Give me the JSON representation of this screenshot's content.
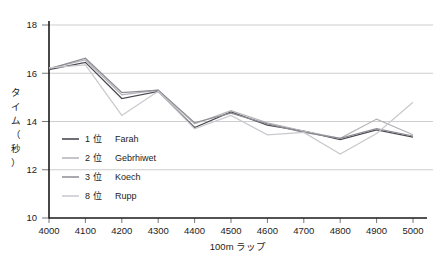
{
  "chart_data": {
    "type": "line",
    "title": "",
    "xlabel": "100m ラップ",
    "ylabel": "タイム（秒）",
    "ylabel_chars": [
      "タ",
      "イ",
      "ム",
      "（",
      "秒",
      "）"
    ],
    "x": [
      4000,
      4100,
      4200,
      4300,
      4400,
      4500,
      4600,
      4700,
      4800,
      4900,
      5000
    ],
    "xtick_labels": [
      "4000",
      "4100",
      "4200",
      "4300",
      "4400",
      "4500",
      "4600",
      "4700",
      "4800",
      "4900",
      "5000"
    ],
    "ytick_labels": [
      "10",
      "12",
      "14",
      "16",
      "18"
    ],
    "yticks": [
      10,
      12,
      14,
      16,
      18
    ],
    "xlim": [
      4000,
      5000
    ],
    "ylim": [
      10,
      18
    ],
    "grid": true,
    "legend_position": "inside-left-lower",
    "series": [
      {
        "name": "1 位  Farah",
        "rank": "1 位",
        "athlete": "Farah",
        "color": "#4a4a52",
        "width": 1.3,
        "values": [
          16.15,
          16.45,
          14.95,
          15.25,
          13.75,
          14.4,
          13.85,
          13.6,
          13.25,
          13.65,
          13.35
        ]
      },
      {
        "name": "2 位  Gebrhiwet",
        "rank": "2 位",
        "athlete": "Gebrhiwet",
        "color": "#b3b3b8",
        "width": 1.2,
        "values": [
          16.2,
          16.55,
          15.1,
          15.3,
          13.9,
          14.45,
          13.95,
          13.6,
          13.3,
          14.1,
          13.45
        ]
      },
      {
        "name": "3 位  Koech",
        "rank": "3 位",
        "athlete": "Koech",
        "color": "#8d8d94",
        "width": 1.2,
        "values": [
          16.18,
          16.62,
          15.2,
          15.3,
          13.95,
          14.35,
          13.9,
          13.55,
          13.3,
          13.7,
          13.4
        ]
      },
      {
        "name": "8 位  Rupp",
        "rank": "8 位",
        "athlete": "Rupp",
        "color": "#c9c9ce",
        "width": 1.2,
        "values": [
          16.22,
          16.35,
          14.25,
          15.25,
          13.7,
          14.25,
          13.45,
          13.55,
          12.65,
          13.5,
          14.8
        ]
      }
    ]
  }
}
